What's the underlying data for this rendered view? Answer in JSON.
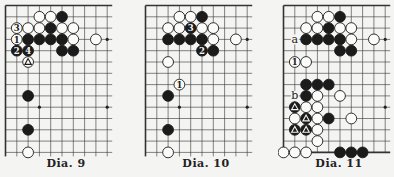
{
  "diagrams": [
    {
      "caption": "Dia. 9",
      "edges": {
        "top": true,
        "left": true,
        "bottom": false
      },
      "cols": 10,
      "rows": 14,
      "stars": [
        [
          9,
          3
        ],
        [
          3,
          9
        ],
        [
          9,
          9
        ]
      ],
      "stones": [
        {
          "c": "W",
          "x": 3,
          "y": 1
        },
        {
          "c": "W",
          "x": 4,
          "y": 1
        },
        {
          "c": "B",
          "x": 5,
          "y": 1
        },
        {
          "c": "W",
          "x": 1,
          "y": 2,
          "label": "3"
        },
        {
          "c": "W",
          "x": 2,
          "y": 2
        },
        {
          "c": "W",
          "x": 3,
          "y": 2
        },
        {
          "c": "B",
          "x": 4,
          "y": 2
        },
        {
          "c": "W",
          "x": 5,
          "y": 2
        },
        {
          "c": "W",
          "x": 6,
          "y": 2
        },
        {
          "c": "W",
          "x": 1,
          "y": 3,
          "label": "1"
        },
        {
          "c": "B",
          "x": 2,
          "y": 3
        },
        {
          "c": "B",
          "x": 3,
          "y": 3
        },
        {
          "c": "B",
          "x": 4,
          "y": 3
        },
        {
          "c": "B",
          "x": 5,
          "y": 3
        },
        {
          "c": "W",
          "x": 6,
          "y": 3
        },
        {
          "c": "W",
          "x": 8,
          "y": 3
        },
        {
          "c": "B",
          "x": 1,
          "y": 4,
          "label": "2"
        },
        {
          "c": "B",
          "x": 2,
          "y": 4,
          "label": "4"
        },
        {
          "c": "B",
          "x": 5,
          "y": 4
        },
        {
          "c": "B",
          "x": 6,
          "y": 4
        },
        {
          "c": "W",
          "x": 2,
          "y": 5,
          "mark": "triangle"
        },
        {
          "c": "B",
          "x": 2,
          "y": 8
        },
        {
          "c": "B",
          "x": 2,
          "y": 11
        },
        {
          "c": "W",
          "x": 2,
          "y": 13
        }
      ],
      "letters": []
    },
    {
      "caption": "Dia. 10",
      "edges": {
        "top": true,
        "left": true,
        "bottom": false
      },
      "cols": 10,
      "rows": 14,
      "stars": [
        [
          9,
          3
        ],
        [
          3,
          9
        ],
        [
          9,
          9
        ]
      ],
      "stones": [
        {
          "c": "W",
          "x": 3,
          "y": 1
        },
        {
          "c": "W",
          "x": 4,
          "y": 1
        },
        {
          "c": "B",
          "x": 5,
          "y": 1
        },
        {
          "c": "W",
          "x": 2,
          "y": 2
        },
        {
          "c": "W",
          "x": 3,
          "y": 2
        },
        {
          "c": "B",
          "x": 4,
          "y": 2,
          "label": "3"
        },
        {
          "c": "W",
          "x": 5,
          "y": 2
        },
        {
          "c": "W",
          "x": 6,
          "y": 2
        },
        {
          "c": "B",
          "x": 2,
          "y": 3
        },
        {
          "c": "B",
          "x": 3,
          "y": 3
        },
        {
          "c": "B",
          "x": 4,
          "y": 3
        },
        {
          "c": "B",
          "x": 5,
          "y": 3
        },
        {
          "c": "W",
          "x": 6,
          "y": 3
        },
        {
          "c": "W",
          "x": 8,
          "y": 3
        },
        {
          "c": "B",
          "x": 5,
          "y": 4,
          "label": "2"
        },
        {
          "c": "B",
          "x": 6,
          "y": 4
        },
        {
          "c": "W",
          "x": 2,
          "y": 5
        },
        {
          "c": "W",
          "x": 3,
          "y": 7,
          "label": "1"
        },
        {
          "c": "B",
          "x": 2,
          "y": 8
        },
        {
          "c": "B",
          "x": 2,
          "y": 11
        },
        {
          "c": "W",
          "x": 2,
          "y": 13
        }
      ],
      "letters": []
    },
    {
      "caption": "Dia. 11",
      "edges": {
        "top": true,
        "left": true,
        "bottom": true
      },
      "cols": 10,
      "rows": 14,
      "stars": [
        [
          9,
          3
        ],
        [
          9,
          9
        ]
      ],
      "stones": [
        {
          "c": "W",
          "x": 3,
          "y": 1
        },
        {
          "c": "W",
          "x": 4,
          "y": 1
        },
        {
          "c": "B",
          "x": 5,
          "y": 1
        },
        {
          "c": "W",
          "x": 2,
          "y": 2
        },
        {
          "c": "W",
          "x": 3,
          "y": 2
        },
        {
          "c": "B",
          "x": 4,
          "y": 2
        },
        {
          "c": "W",
          "x": 5,
          "y": 2
        },
        {
          "c": "W",
          "x": 6,
          "y": 2
        },
        {
          "c": "B",
          "x": 2,
          "y": 3
        },
        {
          "c": "B",
          "x": 3,
          "y": 3
        },
        {
          "c": "B",
          "x": 4,
          "y": 3
        },
        {
          "c": "B",
          "x": 5,
          "y": 3
        },
        {
          "c": "W",
          "x": 6,
          "y": 3
        },
        {
          "c": "W",
          "x": 8,
          "y": 3
        },
        {
          "c": "B",
          "x": 5,
          "y": 4
        },
        {
          "c": "B",
          "x": 6,
          "y": 4
        },
        {
          "c": "W",
          "x": 1,
          "y": 5,
          "label": "1"
        },
        {
          "c": "W",
          "x": 2,
          "y": 5
        },
        {
          "c": "B",
          "x": 2,
          "y": 7
        },
        {
          "c": "B",
          "x": 3,
          "y": 7
        },
        {
          "c": "B",
          "x": 4,
          "y": 7
        },
        {
          "c": "B",
          "x": 2,
          "y": 8
        },
        {
          "c": "W",
          "x": 3,
          "y": 8
        },
        {
          "c": "W",
          "x": 5,
          "y": 8
        },
        {
          "c": "B",
          "x": 1,
          "y": 9,
          "mark": "triangle"
        },
        {
          "c": "W",
          "x": 2,
          "y": 9
        },
        {
          "c": "W",
          "x": 3,
          "y": 9
        },
        {
          "c": "W",
          "x": 1,
          "y": 10
        },
        {
          "c": "B",
          "x": 2,
          "y": 10,
          "mark": "triangle"
        },
        {
          "c": "W",
          "x": 3,
          "y": 10
        },
        {
          "c": "B",
          "x": 4,
          "y": 10
        },
        {
          "c": "W",
          "x": 6,
          "y": 10
        },
        {
          "c": "B",
          "x": 1,
          "y": 11,
          "mark": "triangle"
        },
        {
          "c": "B",
          "x": 2,
          "y": 11,
          "mark": "triangle"
        },
        {
          "c": "W",
          "x": 3,
          "y": 11
        },
        {
          "c": "W",
          "x": 3,
          "y": 12
        },
        {
          "c": "W",
          "x": 0,
          "y": 13
        },
        {
          "c": "W",
          "x": 1,
          "y": 13
        },
        {
          "c": "W",
          "x": 2,
          "y": 13
        },
        {
          "c": "B",
          "x": 5,
          "y": 13
        },
        {
          "c": "B",
          "x": 6,
          "y": 13
        },
        {
          "c": "B",
          "x": 7,
          "y": 13
        }
      ],
      "letters": [
        {
          "x": 1,
          "y": 3,
          "text": "a"
        },
        {
          "x": 1,
          "y": 8,
          "text": "b"
        }
      ]
    }
  ]
}
